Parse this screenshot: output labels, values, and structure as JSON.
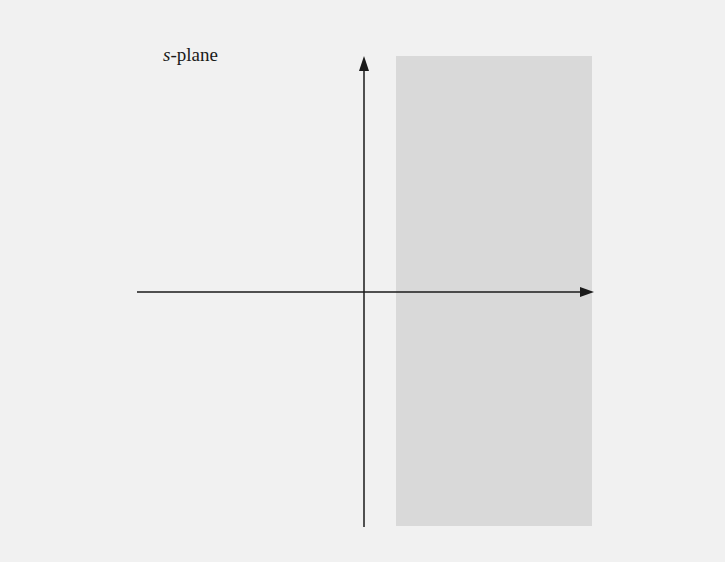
{
  "title": {
    "variable": "s",
    "suffix": "-plane"
  },
  "colors": {
    "background": "#f1f1f1",
    "shaded_region": "#d9d9d9",
    "axis": "#1a1a1a"
  },
  "diagram": {
    "shaded_region": {
      "x": 396,
      "y": 56,
      "width": 196,
      "height": 470
    },
    "horizontal_axis": {
      "x1": 137,
      "y": 292,
      "x2": 593
    },
    "vertical_axis": {
      "x": 364,
      "y1": 527,
      "y2": 56
    }
  }
}
